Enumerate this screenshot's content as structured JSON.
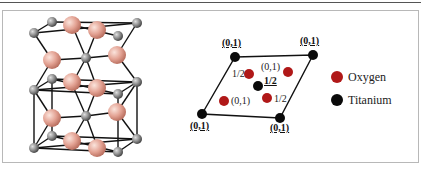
{
  "figure": {
    "colors": {
      "oxygen": "#b01818",
      "titanium": "#0a0a0a",
      "oxygen_3d": "#e8a89a",
      "titanium_3d": "#8a8a8a",
      "frame": "#b8b8b8"
    },
    "left_panel": {
      "description": "3D ball-and-stick model of rutile unit cells"
    },
    "right_panel": {
      "corner_labels": [
        "(0,1)",
        "(0,1)",
        "(0,1)",
        "(0,1)"
      ],
      "inner_labels": {
        "o_upper_left": "1/2",
        "o_upper_right": "(0,1)",
        "ti_center": "1/2",
        "o_lower_right": "1/2",
        "o_lower_left": "(0,1)"
      },
      "legend": [
        {
          "label": "Oxygen",
          "color": "#b01818"
        },
        {
          "label": "Titanium",
          "color": "#0a0a0a"
        }
      ]
    }
  }
}
